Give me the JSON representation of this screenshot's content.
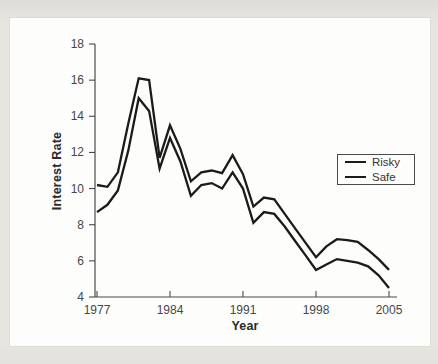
{
  "figure": {
    "outer_background": "#e7e5df",
    "panel_background": "#fdfdfc",
    "axis_color": "#4a4a4a",
    "tick_label_color": "#474747",
    "line_color": "#1b1b1b"
  },
  "chart_data": {
    "type": "line",
    "title": "",
    "xlabel": "Year",
    "ylabel": "Interest Rate",
    "x": [
      1977,
      1978,
      1979,
      1980,
      1981,
      1982,
      1983,
      1984,
      1985,
      1986,
      1987,
      1988,
      1989,
      1990,
      1991,
      1992,
      1993,
      1994,
      1995,
      1996,
      1997,
      1998,
      1999,
      2000,
      2001,
      2002,
      2003,
      2004,
      2005
    ],
    "series": [
      {
        "name": "Risky",
        "color": "#1b1b1b",
        "values": [
          10.2,
          10.1,
          10.9,
          13.6,
          16.1,
          16.0,
          11.7,
          13.5,
          12.2,
          10.4,
          10.9,
          11.0,
          10.85,
          11.85,
          10.8,
          9.0,
          9.5,
          9.4,
          8.6,
          7.8,
          7.0,
          6.2,
          6.8,
          7.2,
          7.15,
          7.05,
          6.6,
          6.1,
          5.5
        ]
      },
      {
        "name": "Safe",
        "color": "#1b1b1b",
        "values": [
          8.7,
          9.1,
          9.9,
          12.1,
          15.0,
          14.3,
          11.1,
          12.8,
          11.5,
          9.6,
          10.2,
          10.3,
          10.0,
          10.9,
          10.0,
          8.1,
          8.7,
          8.6,
          7.9,
          7.1,
          6.3,
          5.5,
          5.8,
          6.1,
          6.0,
          5.9,
          5.7,
          5.2,
          4.5
        ]
      }
    ],
    "xlim": [
      1977,
      2005
    ],
    "ylim": [
      4,
      18
    ],
    "xticks": [
      1977,
      1984,
      1991,
      1998,
      2005
    ],
    "yticks": [
      4,
      6,
      8,
      10,
      12,
      14,
      16,
      18
    ],
    "grid": false,
    "legend": {
      "position": "center-right",
      "entries": [
        "Risky",
        "Safe"
      ]
    }
  }
}
